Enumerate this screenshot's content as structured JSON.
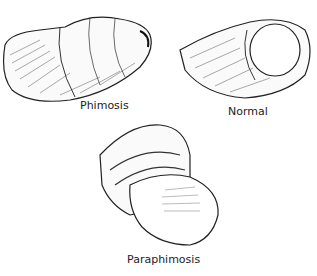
{
  "figures": [
    {
      "label": "Phimosis"
    },
    {
      "label": "Normal"
    },
    {
      "label": "Paraphimosis"
    }
  ]
}
